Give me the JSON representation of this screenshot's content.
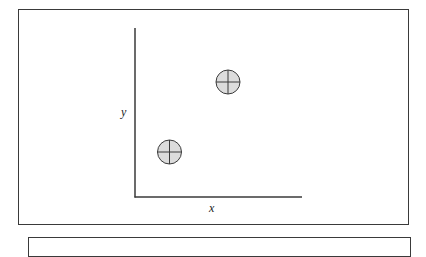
{
  "diagram": {
    "axes": {
      "x_label": "x",
      "y_label": "y"
    },
    "markers": [
      {
        "name": "upper-right-marker",
        "cx": 228,
        "cy": 82,
        "r": 12,
        "symbol": "circle-with-crosshair"
      },
      {
        "name": "lower-left-marker",
        "cx": 169,
        "cy": 152,
        "r": 12,
        "symbol": "circle-with-crosshair"
      }
    ],
    "colors": {
      "stroke": "#3a3a3a",
      "marker_fill": "#dcdcdc",
      "background": "#ffffff"
    }
  }
}
